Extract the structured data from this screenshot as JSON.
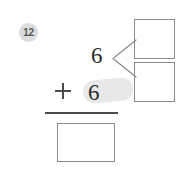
{
  "worksheet": {
    "problem_number": "12",
    "equation": {
      "addend_top": "6",
      "addend_bottom": "6",
      "operator": "+",
      "sum": ""
    },
    "decomposition": {
      "bracket_glyph": "<",
      "part_a": "",
      "part_b": ""
    },
    "highlight_color": "#e8e8e8",
    "badge_color": "#dcdcdc",
    "box_border_color": "#8a8a8a",
    "ink_color": "#2b2b2b"
  }
}
